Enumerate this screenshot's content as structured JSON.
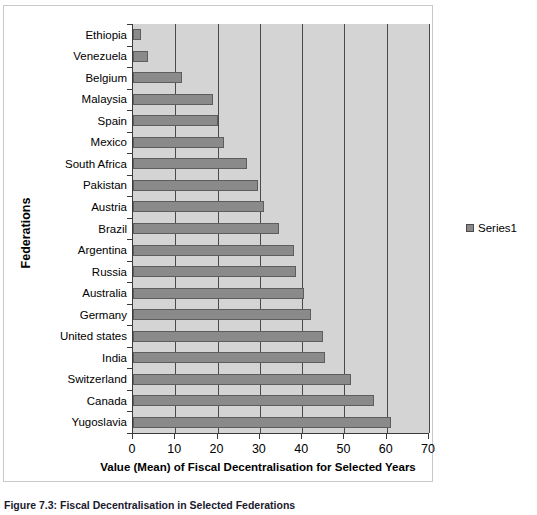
{
  "chart_data": {
    "type": "bar",
    "orientation": "horizontal",
    "title": "",
    "xlabel": "Value (Mean) of Fiscal Decentralisation for Selected Years",
    "ylabel": "Federations",
    "xlim": [
      0,
      70
    ],
    "xticks": [
      "0",
      "10",
      "20",
      "30",
      "40",
      "50",
      "60",
      "70"
    ],
    "grid": "vertical",
    "legend_position": "right",
    "categories": [
      "Ethiopia",
      "Venezuela",
      "Belgium",
      "Malaysia",
      "Spain",
      "Mexico",
      "South Africa",
      "Pakistan",
      "Austria",
      "Brazil",
      "Argentina",
      "Russia",
      "Australia",
      "Germany",
      "United states",
      "India",
      "Switzerland",
      "Canada",
      "Yugoslavia"
    ],
    "series": [
      {
        "name": "Series1",
        "color": "#8a8a8a",
        "values": [
          2,
          3.5,
          11.5,
          19,
          20,
          21.5,
          27,
          29.5,
          31,
          34.5,
          38,
          38.5,
          40.5,
          42,
          45,
          45.5,
          51.5,
          57,
          61
        ]
      }
    ]
  },
  "legend": {
    "swatch_name": "series1-swatch",
    "label": "Series1"
  },
  "caption": {
    "text": "Figure 7.3: Fiscal Decentralisation in Selected Federations"
  },
  "colors": {
    "bar_fill": "#8a8a8a",
    "bar_stroke": "#5d5d5d",
    "plot_background": "#d4d4d4",
    "gridline": "#4a4a4a",
    "axis": "#3a3a3a"
  }
}
